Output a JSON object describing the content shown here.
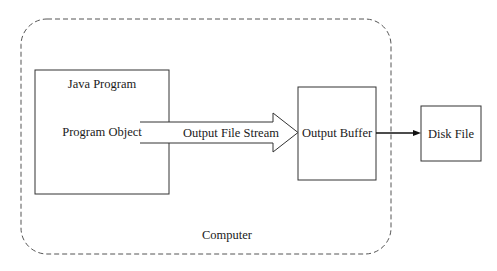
{
  "diagram": {
    "container": {
      "label": "Computer",
      "style": "dashed-rounded"
    },
    "nodes": [
      {
        "id": "java-program",
        "title": "Java Program",
        "inner_label": "Program Object"
      },
      {
        "id": "output-buffer",
        "label": "Output Buffer"
      },
      {
        "id": "disk-file",
        "label": "Disk File"
      }
    ],
    "edges": [
      {
        "from": "java-program",
        "to": "output-buffer",
        "label": "Output File Stream",
        "style": "hollow-block-arrow"
      },
      {
        "from": "output-buffer",
        "to": "disk-file",
        "label": "",
        "style": "solid-arrow"
      }
    ],
    "colors": {
      "stroke": "#333333",
      "dashed": "#555555",
      "background": "#ffffff"
    }
  }
}
